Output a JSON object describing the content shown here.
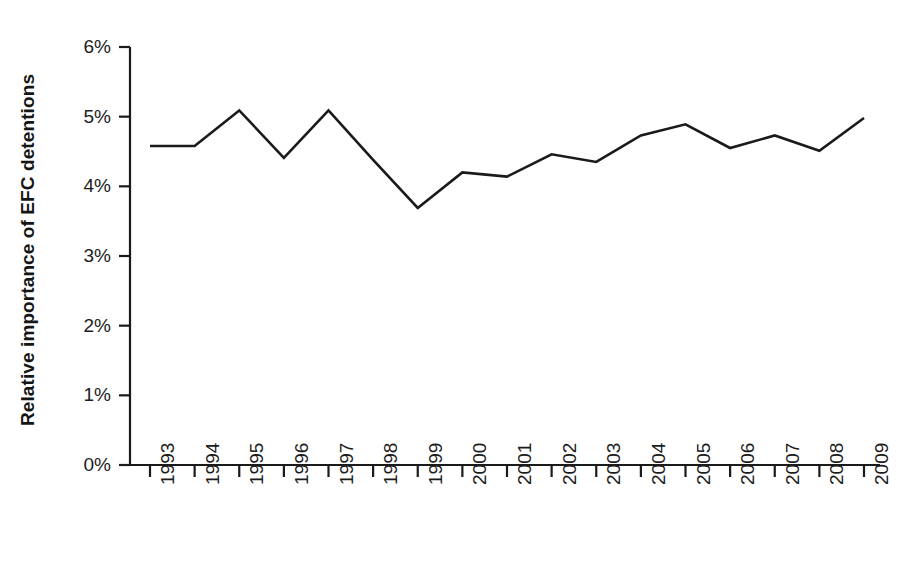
{
  "chart_data": {
    "type": "line",
    "title": "",
    "subtitle": "",
    "xlabel": "",
    "ylabel": "Relative importance of EFC detentions",
    "categories": [
      "1993",
      "1994",
      "1995",
      "1996",
      "1997",
      "1998",
      "1999",
      "2000",
      "2001",
      "2002",
      "2003",
      "2004",
      "2005",
      "2006",
      "2007",
      "2008",
      "2009"
    ],
    "x": [
      1993,
      1994,
      1995,
      1996,
      1997,
      1998,
      1999,
      2000,
      2001,
      2002,
      2003,
      2004,
      2005,
      2006,
      2007,
      2008,
      2009
    ],
    "values": [
      4.58,
      4.58,
      5.09,
      4.41,
      5.09,
      4.38,
      3.69,
      4.2,
      4.14,
      4.46,
      4.35,
      4.73,
      4.89,
      4.55,
      4.73,
      4.51,
      4.98
    ],
    "value_unit": "%",
    "ylim": [
      0,
      6
    ],
    "ytick_values": [
      0,
      1,
      2,
      3,
      4,
      5,
      6
    ],
    "ytick_labels": [
      "0%",
      "1%",
      "2%",
      "3%",
      "4%",
      "5%",
      "6%"
    ],
    "xtick_labels": [
      "1993",
      "1994",
      "1995",
      "1996",
      "1997",
      "1998",
      "1999",
      "2000",
      "2001",
      "2002",
      "2003",
      "2004",
      "2005",
      "2006",
      "2007",
      "2008",
      "2009"
    ],
    "grid": false,
    "legend": false,
    "legend_position": "none",
    "series": [
      {
        "name": "Relative importance of EFC detentions",
        "color": "#1a1a1a",
        "values": [
          4.58,
          4.58,
          5.09,
          4.41,
          5.09,
          4.38,
          3.69,
          4.2,
          4.14,
          4.46,
          4.35,
          4.73,
          4.89,
          4.55,
          4.73,
          4.51,
          4.98
        ]
      }
    ],
    "annotations": []
  },
  "axes": {
    "line_color": "#1a1a1a",
    "tick_color": "#1a1a1a"
  }
}
